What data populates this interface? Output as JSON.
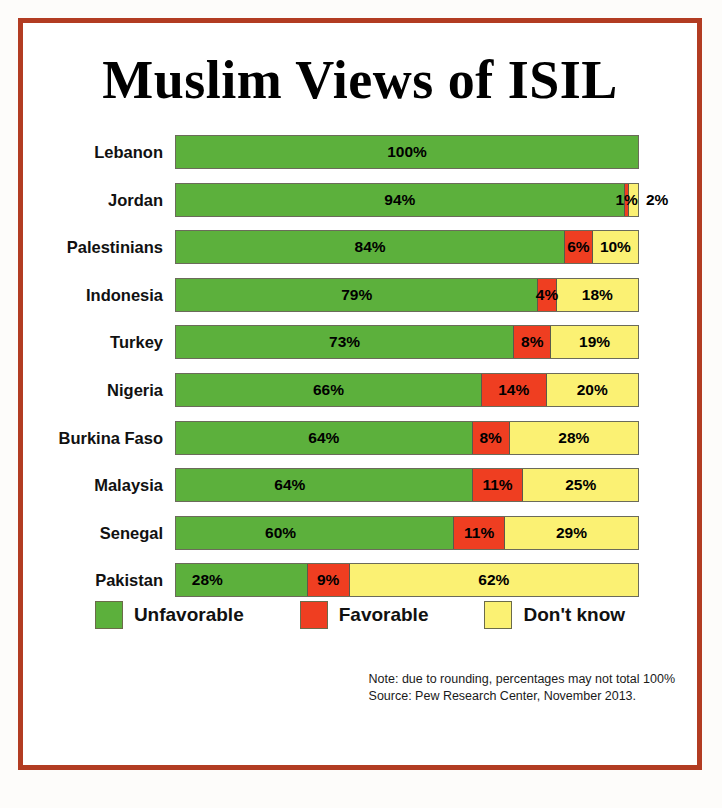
{
  "title": "Muslim Views of ISIL",
  "legend": {
    "items": [
      {
        "label": "Unfavorable",
        "color": "#5cb03c",
        "key": "unfavorable"
      },
      {
        "label": "Favorable",
        "color": "#ef3e21",
        "key": "favorable"
      },
      {
        "label": "Don't know",
        "color": "#fbf173",
        "key": "dont_know"
      }
    ]
  },
  "footnote": {
    "note": "Note: due to rounding, percentages may not total 100%",
    "source": "Source: Pew Research Center, November 2013."
  },
  "rows": [
    {
      "label": "Lebanon",
      "unfavorable": "100%",
      "favorable": "",
      "dont_know": ""
    },
    {
      "label": "Jordan",
      "unfavorable": "94%",
      "favorable": "1%",
      "dont_know": "2%"
    },
    {
      "label": "Palestinians",
      "unfavorable": "84%",
      "favorable": "6%",
      "dont_know": "10%"
    },
    {
      "label": "Indonesia",
      "unfavorable": "79%",
      "favorable": "4%",
      "dont_know": "18%"
    },
    {
      "label": "Turkey",
      "unfavorable": "73%",
      "favorable": "8%",
      "dont_know": "19%"
    },
    {
      "label": "Nigeria",
      "unfavorable": "66%",
      "favorable": "14%",
      "dont_know": "20%"
    },
    {
      "label": "Burkina Faso",
      "unfavorable": "64%",
      "favorable": "8%",
      "dont_know": "28%"
    },
    {
      "label": "Malaysia",
      "unfavorable": "64%",
      "favorable": "11%",
      "dont_know": "25%"
    },
    {
      "label": "Senegal",
      "unfavorable": "60%",
      "favorable": "11%",
      "dont_know": "29%"
    },
    {
      "label": "Pakistan",
      "unfavorable": "28%",
      "favorable": "9%",
      "dont_know": "62%"
    }
  ],
  "chart_data": {
    "type": "bar",
    "orientation": "horizontal",
    "stacked": true,
    "normalized_to_100": true,
    "title": "Muslim Views of ISIL",
    "xlabel": "",
    "ylabel": "",
    "xlim": [
      0,
      100
    ],
    "grid": false,
    "legend_position": "bottom-center",
    "categories": [
      "Lebanon",
      "Jordan",
      "Palestinians",
      "Indonesia",
      "Turkey",
      "Nigeria",
      "Burkina Faso",
      "Malaysia",
      "Senegal",
      "Pakistan"
    ],
    "series": [
      {
        "name": "Unfavorable",
        "color": "#5cb03c",
        "values": [
          100,
          94,
          84,
          79,
          73,
          66,
          64,
          64,
          60,
          28
        ]
      },
      {
        "name": "Favorable",
        "color": "#ef3e21",
        "values": [
          0,
          1,
          6,
          4,
          8,
          14,
          8,
          11,
          11,
          9
        ]
      },
      {
        "name": "Don't know",
        "color": "#fbf173",
        "values": [
          0,
          2,
          10,
          18,
          19,
          20,
          28,
          25,
          29,
          62
        ]
      }
    ],
    "annotations": [
      "Note: due to rounding, percentages may not total 100%",
      "Source: Pew Research Center, November 2013."
    ]
  }
}
